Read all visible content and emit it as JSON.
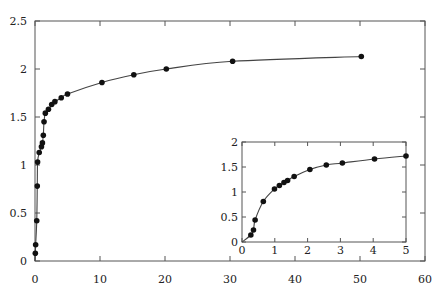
{
  "chart_data": [
    {
      "type": "line",
      "role": "main",
      "title": "",
      "xlabel": "",
      "ylabel": "",
      "xlim": [
        0,
        60
      ],
      "ylim": [
        0,
        2.5
      ],
      "xticks": [
        "0",
        "10",
        "20",
        "30",
        "40",
        "50",
        "60"
      ],
      "yticks": [
        "0",
        "0.5",
        "1",
        "1.5",
        "2",
        "2.5"
      ],
      "grid": false,
      "legend": null,
      "series": [
        {
          "name": "data",
          "marker": "filled-circle",
          "x": [
            0.0,
            0.05,
            0.1,
            0.27,
            0.35,
            0.4,
            0.65,
            0.99,
            1.14,
            1.28,
            1.39,
            1.59,
            2.07,
            2.57,
            3.06,
            4.04,
            5.0,
            10.3,
            15.2,
            20.2,
            30.4,
            50.2
          ],
          "y": [
            0.0,
            0.08,
            0.17,
            0.42,
            0.78,
            1.03,
            1.13,
            1.19,
            1.23,
            1.31,
            1.45,
            1.54,
            1.58,
            1.63,
            1.66,
            1.7,
            1.74,
            1.86,
            1.94,
            2.0,
            2.08,
            2.13
          ]
        }
      ]
    },
    {
      "type": "line",
      "role": "inset",
      "title": "",
      "xlabel": "",
      "ylabel": "",
      "xlim": [
        0,
        5
      ],
      "ylim": [
        0,
        2
      ],
      "xticks": [
        "0",
        "1",
        "2",
        "3",
        "4",
        "5"
      ],
      "yticks": [
        "0",
        "0.5",
        "1",
        "1.5",
        "2"
      ],
      "grid": false,
      "legend": null,
      "series": [
        {
          "name": "data",
          "marker": "filled-circle",
          "x": [
            0.0,
            0.27,
            0.35,
            0.4,
            0.65,
            0.99,
            1.14,
            1.28,
            1.39,
            1.59,
            2.07,
            2.57,
            3.06,
            4.04,
            5.0
          ],
          "y": [
            0.0,
            0.14,
            0.24,
            0.44,
            0.81,
            1.06,
            1.13,
            1.19,
            1.23,
            1.31,
            1.45,
            1.54,
            1.58,
            1.66,
            1.72
          ]
        }
      ]
    }
  ]
}
